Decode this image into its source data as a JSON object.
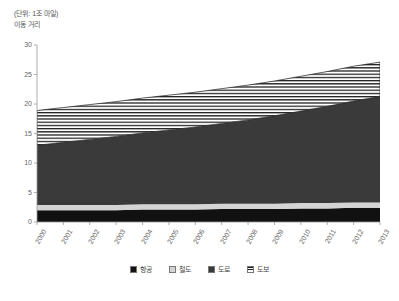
{
  "header": {
    "unit_note": "(단위: 1조 마일)",
    "axis_title": "이동 거리"
  },
  "legend": {
    "position": "bottom",
    "items": [
      {
        "label": "항공",
        "color": "#111111",
        "pattern": "solid",
        "name": "legend-item-air"
      },
      {
        "label": "철도",
        "color": "#d4d4d4",
        "pattern": "solid",
        "name": "legend-item-rail"
      },
      {
        "label": "도로",
        "color": "#3a3a3a",
        "pattern": "solid",
        "name": "legend-item-road"
      },
      {
        "label": "도보",
        "color": "#ffffff",
        "pattern": "hlines",
        "name": "legend-item-walk"
      }
    ]
  },
  "chart_data": {
    "type": "area",
    "title": "",
    "subtitle": "",
    "xlabel": "",
    "ylabel": "이동 거리",
    "unit": "1조 마일",
    "grid": false,
    "stacked": true,
    "xlim": [
      2000,
      2013
    ],
    "ylim": [
      0,
      30
    ],
    "yticks": [
      0,
      5,
      10,
      15,
      20,
      25,
      30
    ],
    "categories": [
      2000,
      2001,
      2002,
      2003,
      2004,
      2005,
      2006,
      2007,
      2008,
      2009,
      2010,
      2011,
      2012,
      2013
    ],
    "xticklabels": [
      "2000",
      "2001",
      "2002",
      "2003",
      "2004",
      "2005",
      "2006",
      "2007",
      "2008",
      "2009",
      "2010",
      "2011",
      "2012",
      "2013"
    ],
    "series": [
      {
        "name": "항공",
        "color": "#111111",
        "pattern": "solid",
        "values": [
          2.0,
          2.0,
          2.0,
          2.0,
          2.1,
          2.1,
          2.1,
          2.2,
          2.2,
          2.2,
          2.3,
          2.3,
          2.4,
          2.4
        ]
      },
      {
        "name": "철도",
        "color": "#d4d4d4",
        "pattern": "solid",
        "values": [
          0.9,
          0.9,
          0.9,
          0.9,
          0.9,
          0.9,
          0.9,
          0.9,
          0.9,
          0.9,
          0.9,
          0.9,
          0.9,
          0.9
        ]
      },
      {
        "name": "도로",
        "color": "#3a3a3a",
        "pattern": "solid",
        "values": [
          10.1,
          10.6,
          11.1,
          11.6,
          12.1,
          12.6,
          13.1,
          13.6,
          14.2,
          14.9,
          15.6,
          16.4,
          17.2,
          18.0
        ]
      },
      {
        "name": "도보",
        "color": "#ffffff",
        "pattern": "hlines",
        "values": [
          5.9,
          5.9,
          5.9,
          5.9,
          5.9,
          5.9,
          5.9,
          5.9,
          5.9,
          5.9,
          5.9,
          5.9,
          5.9,
          5.8
        ]
      }
    ],
    "totals": [
      18.9,
      19.4,
      19.9,
      20.4,
      21.0,
      21.5,
      22.0,
      22.6,
      23.2,
      23.9,
      24.7,
      25.5,
      26.4,
      27.1
    ]
  }
}
